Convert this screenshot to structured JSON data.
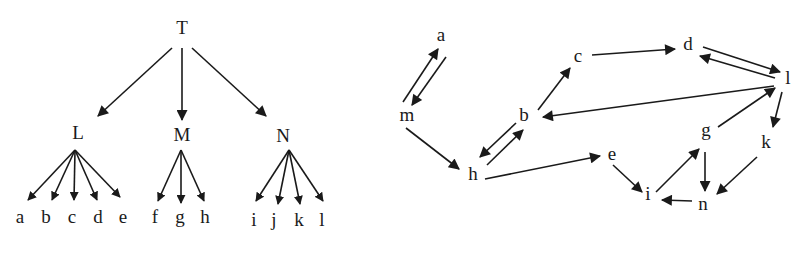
{
  "tree": {
    "nodes": [
      {
        "id": "T",
        "label": "T",
        "x": 182,
        "y": 30
      },
      {
        "id": "L",
        "label": "L",
        "x": 78,
        "y": 135
      },
      {
        "id": "M",
        "label": "M",
        "x": 182,
        "y": 137
      },
      {
        "id": "N",
        "label": "N",
        "x": 283,
        "y": 138
      },
      {
        "id": "a",
        "label": "a",
        "x": 20,
        "y": 219
      },
      {
        "id": "b",
        "label": "b",
        "x": 46,
        "y": 219
      },
      {
        "id": "c",
        "label": "c",
        "x": 72,
        "y": 219
      },
      {
        "id": "d",
        "label": "d",
        "x": 98,
        "y": 219
      },
      {
        "id": "e",
        "label": "e",
        "x": 123,
        "y": 219
      },
      {
        "id": "f",
        "label": "f",
        "x": 155,
        "y": 219
      },
      {
        "id": "g",
        "label": "g",
        "x": 180,
        "y": 219
      },
      {
        "id": "h",
        "label": "h",
        "x": 205,
        "y": 219
      },
      {
        "id": "i",
        "label": "i",
        "x": 254,
        "y": 222
      },
      {
        "id": "j",
        "label": "j",
        "x": 274,
        "y": 222
      },
      {
        "id": "k",
        "label": "k",
        "x": 299,
        "y": 222
      },
      {
        "id": "l",
        "label": "l",
        "x": 322,
        "y": 222
      }
    ],
    "edges": [
      {
        "from": [
          172,
          48
        ],
        "to": [
          98,
          116
        ]
      },
      {
        "from": [
          182,
          48
        ],
        "to": [
          182,
          120
        ]
      },
      {
        "from": [
          192,
          48
        ],
        "to": [
          266,
          116
        ]
      },
      {
        "from": [
          75,
          150
        ],
        "to": [
          28,
          200
        ]
      },
      {
        "from": [
          75,
          150
        ],
        "to": [
          52,
          200
        ]
      },
      {
        "from": [
          75,
          150
        ],
        "to": [
          74,
          200
        ]
      },
      {
        "from": [
          75,
          150
        ],
        "to": [
          97,
          200
        ]
      },
      {
        "from": [
          75,
          150
        ],
        "to": [
          120,
          197
        ]
      },
      {
        "from": [
          181,
          150
        ],
        "to": [
          158,
          201
        ]
      },
      {
        "from": [
          181,
          150
        ],
        "to": [
          181,
          203
        ]
      },
      {
        "from": [
          181,
          150
        ],
        "to": [
          204,
          201
        ]
      },
      {
        "from": [
          289,
          150
        ],
        "to": [
          256,
          201
        ]
      },
      {
        "from": [
          289,
          150
        ],
        "to": [
          278,
          204
        ]
      },
      {
        "from": [
          289,
          150
        ],
        "to": [
          300,
          204
        ]
      },
      {
        "from": [
          289,
          150
        ],
        "to": [
          323,
          201
        ]
      }
    ]
  },
  "graph": {
    "nodes": [
      {
        "id": "a",
        "label": "a",
        "x": 441,
        "y": 37
      },
      {
        "id": "m",
        "label": "m",
        "x": 407,
        "y": 117
      },
      {
        "id": "h",
        "label": "h",
        "x": 473,
        "y": 176
      },
      {
        "id": "b",
        "label": "b",
        "x": 524,
        "y": 117
      },
      {
        "id": "c",
        "label": "c",
        "x": 578,
        "y": 58
      },
      {
        "id": "d",
        "label": "d",
        "x": 688,
        "y": 46
      },
      {
        "id": "l",
        "label": "l",
        "x": 788,
        "y": 80
      },
      {
        "id": "g",
        "label": "g",
        "x": 706,
        "y": 132
      },
      {
        "id": "k",
        "label": "k",
        "x": 766,
        "y": 144
      },
      {
        "id": "e",
        "label": "e",
        "x": 612,
        "y": 156
      },
      {
        "id": "i",
        "label": "i",
        "x": 648,
        "y": 196
      },
      {
        "id": "n",
        "label": "n",
        "x": 703,
        "y": 206
      }
    ],
    "edges": [
      {
        "from": "m",
        "to": "a",
        "p1": [
          403,
          102
        ],
        "p2": [
          438,
          49
        ]
      },
      {
        "from": "a",
        "to": "m",
        "p1": [
          446,
          57
        ],
        "p2": [
          412,
          105
        ]
      },
      {
        "from": "m",
        "to": "h",
        "p1": [
          406,
          128
        ],
        "p2": [
          459,
          169
        ]
      },
      {
        "from": "h",
        "to": "b",
        "p1": [
          487,
          165
        ],
        "p2": [
          523,
          130
        ]
      },
      {
        "from": "b",
        "to": "h",
        "p1": [
          516,
          123
        ],
        "p2": [
          480,
          157
        ]
      },
      {
        "from": "b",
        "to": "c",
        "p1": [
          538,
          110
        ],
        "p2": [
          570,
          68
        ]
      },
      {
        "from": "c",
        "to": "d",
        "p1": [
          592,
          55
        ],
        "p2": [
          675,
          49
        ]
      },
      {
        "from": "d",
        "to": "l",
        "p1": [
          703,
          47
        ],
        "p2": [
          780,
          72
        ]
      },
      {
        "from": "l",
        "to": "d",
        "p1": [
          775,
          78
        ],
        "p2": [
          700,
          56
        ]
      },
      {
        "from": "l",
        "to": "b",
        "p1": [
          774,
          86
        ],
        "p2": [
          543,
          117
        ]
      },
      {
        "from": "h",
        "to": "e",
        "p1": [
          485,
          179
        ],
        "p2": [
          600,
          156
        ]
      },
      {
        "from": "e",
        "to": "i",
        "p1": [
          613,
          165
        ],
        "p2": [
          642,
          192
        ]
      },
      {
        "from": "i",
        "to": "g",
        "p1": [
          656,
          192
        ],
        "p2": [
          699,
          149
        ]
      },
      {
        "from": "g",
        "to": "l",
        "p1": [
          718,
          127
        ],
        "p2": [
          775,
          88
        ]
      },
      {
        "from": "l",
        "to": "k",
        "p1": [
          782,
          92
        ],
        "p2": [
          773,
          127
        ]
      },
      {
        "from": "g",
        "to": "n",
        "p1": [
          705,
          152
        ],
        "p2": [
          705,
          191
        ]
      },
      {
        "from": "k",
        "to": "n",
        "p1": [
          757,
          157
        ],
        "p2": [
          717,
          194
        ]
      },
      {
        "from": "n",
        "to": "i",
        "p1": [
          692,
          201
        ],
        "p2": [
          662,
          200
        ]
      }
    ]
  }
}
